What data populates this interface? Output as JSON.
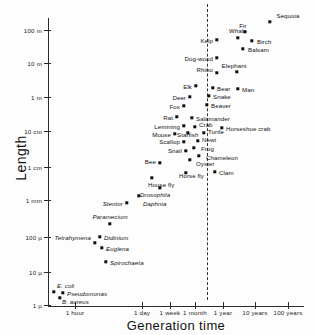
{
  "chart_data": {
    "type": "scatter",
    "title": "",
    "xlabel": "Generation time",
    "ylabel": "Length",
    "xscale": "log",
    "yscale": "log",
    "grid": false,
    "legend": null,
    "xticks": [
      {
        "label": "1 hour",
        "px": 75
      },
      {
        "label": "1 day",
        "px": 142
      },
      {
        "label": "1 week",
        "px": 170
      },
      {
        "label": "1 month",
        "px": 195
      },
      {
        "label": "1 year",
        "px": 223
      },
      {
        "label": "10 years",
        "px": 255
      },
      {
        "label": "100 years",
        "px": 288
      }
    ],
    "yticks": [
      {
        "label": "100 m",
        "px": 30
      },
      {
        "label": "10 m",
        "px": 63
      },
      {
        "label": "1 m",
        "px": 97
      },
      {
        "label": "10 cm",
        "px": 131
      },
      {
        "label": "1 cm",
        "px": 167
      },
      {
        "label": "1 mm",
        "px": 200
      },
      {
        "label": "100 µ",
        "px": 237
      },
      {
        "label": "10 µ",
        "px": 272
      },
      {
        "label": "1 µ",
        "px": 305
      }
    ],
    "annotations": [
      {
        "name": "one-year-reference-line",
        "type": "vertical-dashed-line",
        "x_px": 207,
        "label": ""
      }
    ],
    "points": [
      {
        "label": "Sequoia",
        "x": 270,
        "y": 22,
        "lx": 288,
        "ly": 15,
        "align": "c",
        "style": "roman"
      },
      {
        "label": "Fir",
        "x": 245,
        "y": 32,
        "lx": 243,
        "ly": 25,
        "align": "c",
        "style": "roman"
      },
      {
        "label": "Birch",
        "x": 252,
        "y": 41,
        "lx": 257,
        "ly": 41,
        "align": "l",
        "style": "roman"
      },
      {
        "label": "Whale",
        "x": 238,
        "y": 38,
        "lx": 238,
        "ly": 30,
        "align": "c",
        "style": "roman"
      },
      {
        "label": "Balsam",
        "x": 243,
        "y": 49,
        "lx": 248,
        "ly": 49,
        "align": "l",
        "style": "roman"
      },
      {
        "label": "Kelp",
        "x": 217,
        "y": 40,
        "lx": 213,
        "ly": 40,
        "align": "r",
        "style": "roman"
      },
      {
        "label": "Dog-wood",
        "x": 217,
        "y": 58,
        "lx": 213,
        "ly": 58,
        "align": "r",
        "style": "roman"
      },
      {
        "label": "Elephant",
        "x": 237,
        "y": 72,
        "lx": 234,
        "ly": 65,
        "align": "c",
        "style": "roman"
      },
      {
        "label": "Rhino",
        "x": 217,
        "y": 73,
        "lx": 213,
        "ly": 69,
        "align": "r",
        "style": "roman"
      },
      {
        "label": "Man",
        "x": 238,
        "y": 89,
        "lx": 242,
        "ly": 89,
        "align": "l",
        "style": "roman"
      },
      {
        "label": "Bear",
        "x": 213,
        "y": 88,
        "lx": 217,
        "ly": 88,
        "align": "l",
        "style": "roman"
      },
      {
        "label": "Elk",
        "x": 196,
        "y": 86,
        "lx": 192,
        "ly": 86,
        "align": "r",
        "style": "roman"
      },
      {
        "label": "Snake",
        "x": 209,
        "y": 96,
        "lx": 213,
        "ly": 96,
        "align": "l",
        "style": "roman"
      },
      {
        "label": "Deer",
        "x": 190,
        "y": 97,
        "lx": 186,
        "ly": 97,
        "align": "r",
        "style": "roman"
      },
      {
        "label": "Beaver",
        "x": 207,
        "y": 105,
        "lx": 211,
        "ly": 105,
        "align": "l",
        "style": "roman"
      },
      {
        "label": "Fox",
        "x": 184,
        "y": 106,
        "lx": 180,
        "ly": 106,
        "align": "r",
        "style": "roman"
      },
      {
        "label": "Salamander",
        "x": 192,
        "y": 118,
        "lx": 196,
        "ly": 118,
        "align": "l",
        "style": "roman"
      },
      {
        "label": "Rat",
        "x": 177,
        "y": 117,
        "lx": 173,
        "ly": 117,
        "align": "r",
        "style": "roman"
      },
      {
        "label": "Crab",
        "x": 195,
        "y": 127,
        "lx": 199,
        "ly": 124,
        "align": "l",
        "style": "roman"
      },
      {
        "label": "Horseshoe crab",
        "x": 222,
        "y": 128,
        "lx": 226,
        "ly": 128,
        "align": "l",
        "style": "roman"
      },
      {
        "label": "Lemming",
        "x": 184,
        "y": 126,
        "lx": 180,
        "ly": 126,
        "align": "r",
        "style": "roman"
      },
      {
        "label": "Mouse",
        "x": 175,
        "y": 134,
        "lx": 171,
        "ly": 134,
        "align": "r",
        "style": "roman"
      },
      {
        "label": "Starfish",
        "x": 188,
        "y": 133,
        "lx": 177,
        "ly": 134,
        "align": "l",
        "style": "roman"
      },
      {
        "label": "Turtle",
        "x": 204,
        "y": 133,
        "lx": 208,
        "ly": 131,
        "align": "l",
        "style": "roman"
      },
      {
        "label": "Newt",
        "x": 198,
        "y": 141,
        "lx": 202,
        "ly": 139,
        "align": "l",
        "style": "roman"
      },
      {
        "label": "Scallop",
        "x": 184,
        "y": 142,
        "lx": 180,
        "ly": 141,
        "align": "r",
        "style": "roman"
      },
      {
        "label": "Frog",
        "x": 194,
        "y": 148,
        "lx": 201,
        "ly": 148,
        "align": "l",
        "style": "roman"
      },
      {
        "label": "Snail",
        "x": 186,
        "y": 151,
        "lx": 182,
        "ly": 150,
        "align": "r",
        "style": "roman"
      },
      {
        "label": "Chameleon",
        "x": 199,
        "y": 156,
        "lx": 206,
        "ly": 157,
        "align": "l",
        "style": "roman"
      },
      {
        "label": "Oyster",
        "x": 190,
        "y": 160,
        "lx": 196,
        "ly": 163,
        "align": "l",
        "style": "roman"
      },
      {
        "label": "Bee",
        "x": 160,
        "y": 163,
        "lx": 156,
        "ly": 161,
        "align": "r",
        "style": "roman"
      },
      {
        "label": "Clam",
        "x": 215,
        "y": 172,
        "lx": 219,
        "ly": 172,
        "align": "l",
        "style": "roman"
      },
      {
        "label": "Horse fly",
        "x": 186,
        "y": 173,
        "lx": 179,
        "ly": 175,
        "align": "l",
        "style": "roman"
      },
      {
        "label": "House fly",
        "x": 152,
        "y": 178,
        "lx": 148,
        "ly": 184,
        "align": "l",
        "style": "roman"
      },
      {
        "label": "Drosophila",
        "x": 160,
        "y": 188,
        "lx": 140,
        "ly": 194,
        "align": "l",
        "style": "italic"
      },
      {
        "label": "Daphnia",
        "x": 139,
        "y": 196,
        "lx": 143,
        "ly": 203,
        "align": "l",
        "style": "italic"
      },
      {
        "label": "Stentor",
        "x": 127,
        "y": 203,
        "lx": 123,
        "ly": 203,
        "align": "r",
        "style": "italic"
      },
      {
        "label": "Paramecium",
        "x": 110,
        "y": 224,
        "lx": 110,
        "ly": 216,
        "align": "c",
        "style": "italic"
      },
      {
        "label": "Didinium",
        "x": 100,
        "y": 237,
        "lx": 104,
        "ly": 237,
        "align": "l",
        "style": "italic"
      },
      {
        "label": "Tetrahymena",
        "x": 95,
        "y": 243,
        "lx": 91,
        "ly": 237,
        "align": "r",
        "style": "italic"
      },
      {
        "label": "Euglena",
        "x": 102,
        "y": 248,
        "lx": 106,
        "ly": 248,
        "align": "l",
        "style": "italic"
      },
      {
        "label": "Spirochaeta",
        "x": 106,
        "y": 262,
        "lx": 110,
        "ly": 262,
        "align": "l",
        "style": "italic"
      },
      {
        "label": "E. coli",
        "x": 54,
        "y": 292,
        "lx": 57,
        "ly": 285,
        "align": "l",
        "style": "italic"
      },
      {
        "label": "Pseudomonas",
        "x": 63,
        "y": 293,
        "lx": 67,
        "ly": 293,
        "align": "l",
        "style": "italic"
      },
      {
        "label": "B. aureus",
        "x": 60,
        "y": 298,
        "lx": 62,
        "ly": 301,
        "align": "l",
        "style": "italic"
      }
    ]
  }
}
